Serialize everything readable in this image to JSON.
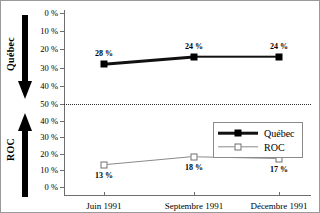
{
  "chart_data": {
    "type": "line",
    "title": "",
    "subtitle": "",
    "xlabel": "",
    "ylabel": "",
    "grid": false,
    "legend_position": "lower-right",
    "categories": [
      "Juin 1991",
      "Septembre 1991",
      "Décembre 1991"
    ],
    "series": [
      {
        "name": "Québec",
        "values": [
          28,
          24,
          24
        ],
        "point_labels": [
          "28 %",
          "24 %",
          "24 %"
        ],
        "marker": "filled-square",
        "color": "#111111",
        "panel": "upper",
        "axis_inverted": true
      },
      {
        "name": "ROC",
        "values": [
          13,
          18,
          17
        ],
        "point_labels": [
          "13 %",
          "18 %",
          "17 %"
        ],
        "marker": "open-square",
        "color": "#8a8a8a",
        "panel": "lower",
        "axis_inverted": false
      }
    ],
    "upper_axis": {
      "ticks": [
        0,
        10,
        20,
        30,
        40,
        50
      ],
      "tick_labels": [
        "0 %",
        "10 %",
        "20 %",
        "30 %",
        "40 %",
        "50 %"
      ],
      "ylim": [
        0,
        50
      ],
      "direction": "top-to-bottom"
    },
    "lower_axis": {
      "ticks": [
        50,
        40,
        30,
        20,
        10,
        0
      ],
      "tick_labels": [
        "50 %",
        "40 %",
        "30 %",
        "20 %",
        "10 %",
        "0 %"
      ],
      "ylim": [
        0,
        50
      ],
      "direction": "top-to-bottom"
    },
    "midline_label": "50 %",
    "annotations": []
  },
  "side_labels": {
    "upper": "Québec",
    "lower": "ROC"
  },
  "legend": {
    "items": [
      {
        "label": "Québec"
      },
      {
        "label": "ROC"
      }
    ]
  },
  "colors": {
    "quebec": "#111111",
    "roc": "#8a8a8a",
    "axis": "#6e6e6e",
    "midline": "#2b2b2b"
  }
}
